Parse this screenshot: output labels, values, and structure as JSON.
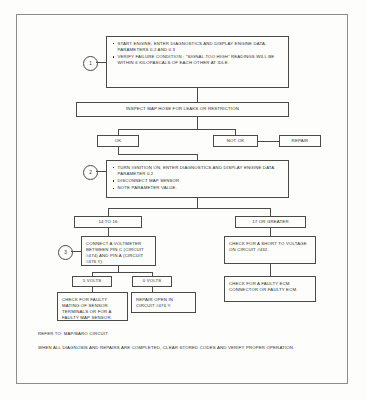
{
  "document": {
    "type": "diagnostic-flowchart",
    "title": "MAP Sensor Signal Too High Diagnostic Chart"
  },
  "steps": {
    "one": "1",
    "two": "2",
    "three": "3"
  },
  "boxes": {
    "step1": {
      "bullets": [
        "START ENGINE, ENTER DIAGNOSTICS AND DISPLAY ENGINE DATA PARAMETERS  0.2 AND  0.3",
        "VERIFY FAILURE CONDITION :  “SIGNAL TOO HIGH” READINGS WILL BE WITHIN 6 KILOPASCALS OF EACH OTHER AT IDLE."
      ]
    },
    "inspect_hose": "INSPECT MAP HOSE FOR LEAKS OR RESTRICTION",
    "ok": "OK",
    "not_ok": "NOT OK",
    "repair": "REPAIR",
    "step2": {
      "bullets": [
        "TURN IGNITION ON, ENTER DIAGNOSTICS AND DISPLAY ENGINE DATA PARAMETER  0.2",
        "DISCONNECT MAP SENSOR.",
        "NOTE PARAMETER VALUE."
      ]
    },
    "range_low": "14 TO 16",
    "range_high": "17 OR GREATER",
    "step3": "CONNECT A VOLTMETER BETWEEN PIN C (CIRCUIT #474) AND PIN A (CIRCUIT #476 Y).",
    "short_to_voltage": "CHECK FOR A SHORT TO VOLTAGE  ON  CIRCUIT #432.",
    "volts_5": "5 VOLTS",
    "volts_0": "0 VOLTS",
    "faulty_mating": "CHECK FOR FAULTY MATING OF SENSOR TERMINALS OR FOR A FAULTY MAP SENSOR.",
    "repair_open": "REPAIR OPEN IN CIRCUIT #476 Y.",
    "faulty_ecm": "CHECK FOR A FAULTY ECM CONNECTOR OR FAULTY ECM."
  },
  "notes": {
    "refer": "REFER TO:  MAP/BARO CIRCUIT.",
    "verify": "WHEN ALL DIAGNOSIS AND REPAIRS ARE COMPLETED, CLEAR STORED CODES AND VERIFY PROPER OPERATION."
  },
  "colors": {
    "ink": "#2b2b2b",
    "rule": "#4a4a48",
    "frame": "#8d8d88",
    "paper": "#fdfdfb"
  }
}
